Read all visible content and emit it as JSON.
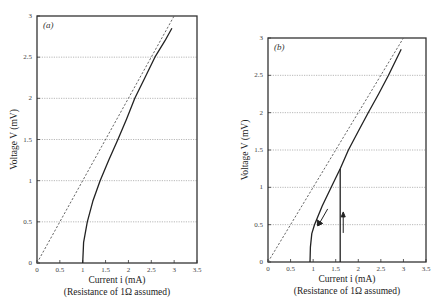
{
  "chart_data": [
    {
      "type": "line",
      "panel_label": "(a)",
      "xlabel": "Current i (mA)",
      "xlabel_note": "(Resistance of 1Ω assumed)",
      "ylabel": "Voltage V (mV)",
      "xlim": [
        0,
        3.5
      ],
      "ylim": [
        0,
        3
      ],
      "xticks": [
        "0",
        "0.5",
        "1",
        "1.5",
        "2",
        "2.5",
        "3",
        "3.5"
      ],
      "yticks": [
        "0",
        "0.5",
        "1",
        "1.5",
        "2",
        "2.5",
        "3"
      ],
      "grid": "horizontal dotted",
      "series": [
        {
          "name": "ohmic reference (V = iR)",
          "style": "dashed",
          "x": [
            0,
            3.0
          ],
          "y": [
            0,
            3.0
          ]
        },
        {
          "name": "measured V-i",
          "style": "solid",
          "x": [
            1.0,
            1.02,
            1.1,
            1.22,
            1.38,
            1.57,
            1.77,
            1.96,
            2.14,
            2.36,
            2.58,
            2.8,
            2.95
          ],
          "y": [
            0.0,
            0.25,
            0.5,
            0.75,
            1.0,
            1.25,
            1.5,
            1.75,
            2.0,
            2.25,
            2.5,
            2.7,
            2.85
          ]
        }
      ]
    },
    {
      "type": "line",
      "panel_label": "(b)",
      "xlabel": "Current i (mA)",
      "xlabel_note": "(Resistance of 1Ω assumed)",
      "ylabel": "Voltage V (mV)",
      "xlim": [
        0,
        3.5
      ],
      "ylim": [
        0,
        3
      ],
      "xticks": [
        "0",
        "0.5",
        "1",
        "1.5",
        "2",
        "2.5",
        "3",
        "3.5"
      ],
      "yticks": [
        "0",
        "0.5",
        "1",
        "1.5",
        "2",
        "2.5",
        "3"
      ],
      "grid": "horizontal dotted",
      "series": [
        {
          "name": "ohmic reference (V = iR)",
          "style": "dashed",
          "x": [
            0,
            3.0
          ],
          "y": [
            0,
            3.0
          ]
        },
        {
          "name": "increasing current (jump)",
          "style": "solid",
          "direction": "up",
          "x": [
            1.6,
            1.6
          ],
          "y": [
            0.0,
            1.25
          ]
        },
        {
          "name": "measured V-i (upper branch & decreasing)",
          "style": "solid",
          "x": [
            0.93,
            0.94,
            0.97,
            1.03,
            1.2,
            1.4,
            1.6,
            1.78,
            2.0,
            2.22,
            2.45,
            2.67,
            2.95
          ],
          "y": [
            0.0,
            0.2,
            0.38,
            0.5,
            0.75,
            1.0,
            1.25,
            1.5,
            1.75,
            2.0,
            2.25,
            2.5,
            2.85
          ]
        }
      ],
      "annotations": [
        {
          "type": "arrow",
          "direction": "up",
          "at": [
            1.6,
            0.55
          ]
        },
        {
          "type": "arrow",
          "direction": "down-left",
          "at": [
            1.1,
            0.55
          ]
        }
      ]
    }
  ]
}
